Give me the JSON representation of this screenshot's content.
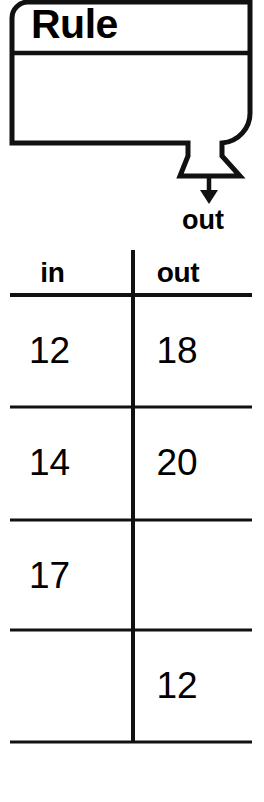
{
  "machine": {
    "title": "Rule",
    "rule_text": "",
    "output_arrow_label": "out",
    "shape": "function-machine-funnel"
  },
  "table": {
    "columns": [
      "in",
      "out"
    ],
    "rows": [
      {
        "in": "12",
        "out": "18"
      },
      {
        "in": "14",
        "out": "20"
      },
      {
        "in": "17",
        "out": ""
      },
      {
        "in": "",
        "out": "12"
      }
    ]
  },
  "colors": {
    "ink": "#000000",
    "paper": "#ffffff"
  }
}
